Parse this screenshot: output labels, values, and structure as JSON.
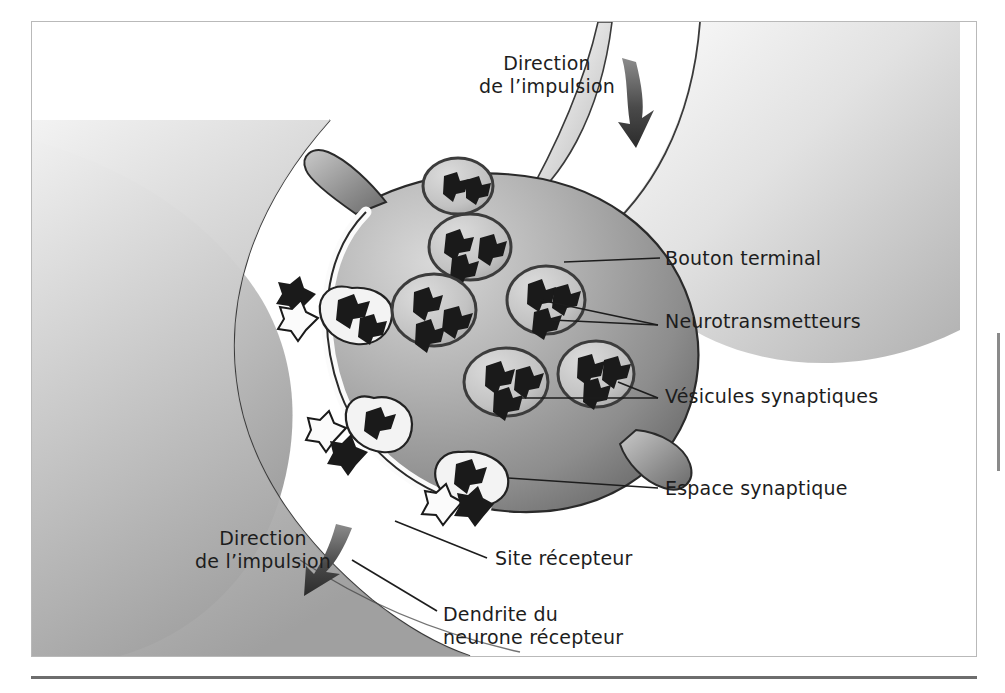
{
  "figure": {
    "kind": "scientific-illustration",
    "language": "fr",
    "colors": {
      "frame_border": "#b9b9b9",
      "bottom_rule": "#6d6d6d",
      "label_text": "#1d1d1d",
      "leader_line": "#1d1d1d",
      "cell_light": "#e8e8e8",
      "cell_mid": "#a8a8a8",
      "cell_dark": "#6f6f6f",
      "membrane_outline": "#2a2a2a",
      "vesicle_fill": "#c9c9c9",
      "neurotransmitter": "#1a1a1a",
      "cleft_white": "#fbfbfb",
      "background": "#ffffff"
    }
  },
  "labels": {
    "direction_top": "Direction\nde l’impulsion",
    "direction_bottom": "Direction\nde l’impulsion",
    "bouton_terminal": "Bouton terminal",
    "neurotransmetteurs": "Neurotransmetteurs",
    "vesicules_synaptiques": "Vésicules synaptiques",
    "espace_synaptique": "Espace synaptique",
    "site_recepteur": "Site récepteur",
    "dendrite_neurone_recepteur": "Dendrite du\nneurone récepteur"
  },
  "structures": {
    "axon_terminal": "Bouton terminal (presynaptic axon ending)",
    "vesicle_count_interior": 6,
    "vesicle_count_fusing": 3,
    "receptor_site_count": 3,
    "impulse_arrows": 2
  }
}
